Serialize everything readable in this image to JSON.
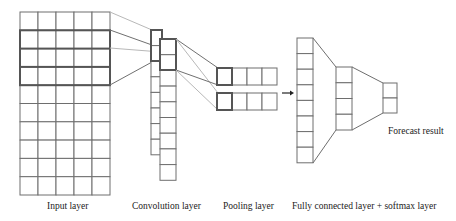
{
  "diagram": {
    "type": "cnn-architecture",
    "layers": [
      {
        "id": "input",
        "label": "Input layer",
        "rows": 10,
        "cols": 5,
        "highlighted_windows": [
          [
            1,
            3
          ],
          [
            2,
            4
          ]
        ]
      },
      {
        "id": "convolution",
        "label": "Convolution layer",
        "feature_maps": 2,
        "cells_per_map": [
          8,
          9
        ]
      },
      {
        "id": "pooling",
        "label": "Pooling layer",
        "feature_maps": 2,
        "cells_per_map": 4
      },
      {
        "id": "fully_connected",
        "label": "Fully connected layer + softmax layer",
        "columns": [
          8,
          4,
          2
        ]
      },
      {
        "id": "output",
        "label": "Forecast result",
        "cells": 2
      }
    ],
    "arrow": {
      "from": "pooling",
      "to": "fully_connected"
    },
    "colors": {
      "cell_stroke": "#6e6e6e",
      "highlight_stroke": "#555555",
      "light_connector": "#b8b8b8",
      "dark_connector": "#707070",
      "background": "#ffffff"
    }
  },
  "labels": {
    "input": "Input layer",
    "convolution": "Convolution layer",
    "pooling": "Pooling layer",
    "fully_connected": "Fully connected layer + softmax layer",
    "forecast": "Forecast result"
  }
}
